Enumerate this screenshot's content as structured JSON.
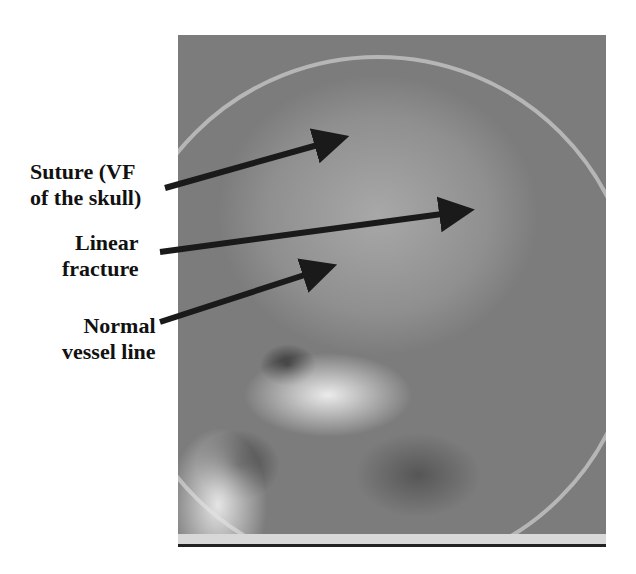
{
  "figure": {
    "type": "lateral skull X-ray with annotations",
    "labels": [
      {
        "id": "suture",
        "lines": [
          "Suture (VF",
          "of the skull)"
        ]
      },
      {
        "id": "linear-fracture",
        "lines": [
          "Linear",
          "fracture"
        ]
      },
      {
        "id": "vessel-line",
        "lines": [
          "Normal",
          "vessel line"
        ]
      }
    ],
    "arrows": [
      {
        "target": "suture",
        "x1": 165,
        "y1": 188,
        "x2": 332,
        "y2": 141
      },
      {
        "target": "linear-fracture",
        "x1": 160,
        "y1": 252,
        "x2": 457,
        "y2": 212
      },
      {
        "target": "vessel-line",
        "x1": 160,
        "y1": 322,
        "x2": 320,
        "y2": 270
      }
    ],
    "colors": {
      "arrow": "#1a1a1a",
      "label": "#111111",
      "background": "#ffffff"
    }
  }
}
